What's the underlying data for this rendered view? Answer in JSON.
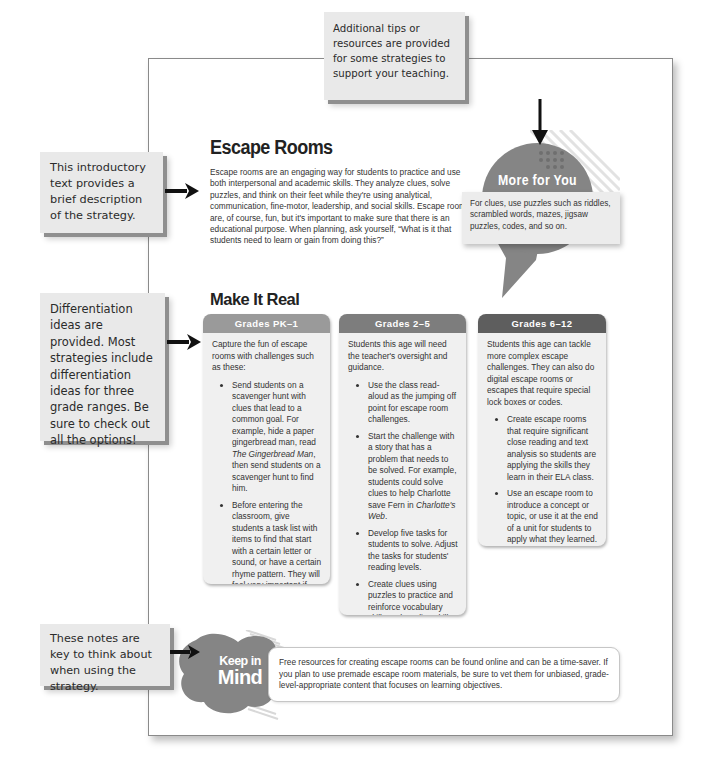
{
  "callouts": {
    "resources": "Additional tips or resources are provided for some strategies to support your teaching.",
    "intro": "This introductory text provides a brief description of the strategy.",
    "differentiation": "Differentiation ideas are provided. Most strategies include differentiation ideas for three grade ranges. Be sure to check out all the options!",
    "keep_in_mind": "These notes are key to think about when using the strategy."
  },
  "strategy": {
    "title": "Escape Rooms",
    "description": "Escape rooms are an engaging way for students to practice and use both interpersonal and academic skills. They analyze clues, solve puzzles, and think on their feet while they're using analytical, communication, fine-motor, leadership, and social skills. Escape rooms are, of course, fun, but it's important to make sure that there is an educational purpose. When planning, ask yourself, “What is it that students need to learn or gain from doing this?”"
  },
  "more_for_you": {
    "title": "More for You",
    "text": "For clues, use puzzles such as riddles, scrambled words, mazes, jigsaw puzzles, codes, and so on."
  },
  "make_it_real": {
    "title": "Make It Real",
    "cards": [
      {
        "header": "Grades PK–1",
        "header_color": "#9a9a9a",
        "intro": "Capture the fun of escape rooms with challenges such as these:",
        "bullets": [
          {
            "before": "Send students on a scavenger hunt with clues that lead to a common goal. For example, hide a paper gingerbread man, read ",
            "italic": "The Gingerbread Man",
            "after": ", then send students on a scavenger hunt to find him."
          },
          {
            "before": "Before entering the classroom, give students a task list with items to find that start with a certain letter or sound, or have a certain rhyme pattern. They will feel very important if you give them clipboards!",
            "italic": "",
            "after": ""
          }
        ]
      },
      {
        "header": "Grades 2–5",
        "header_color": "#7d7d7d",
        "intro": "Students this age will need the teacher's oversight and guidance.",
        "bullets": [
          {
            "before": "Use the class read-aloud as the jumping off point for escape room challenges.",
            "italic": "",
            "after": ""
          },
          {
            "before": "Start the challenge with a story that has a problem that needs to be solved. For example, students could solve clues to help Charlotte save Fern in ",
            "italic": "Charlotte's Web",
            "after": "."
          },
          {
            "before": "Develop five tasks for students to solve. Adjust the tasks for students' reading levels.",
            "italic": "",
            "after": ""
          },
          {
            "before": "Create clues using puzzles to practice and reinforce vocabulary skills and reading skills.",
            "italic": "",
            "after": ""
          }
        ]
      },
      {
        "header": "Grades 6–12",
        "header_color": "#5e5e5e",
        "intro": "Students this age can tackle more complex escape challenges. They can also do digital escape rooms or escapes that require special lock boxes or codes.",
        "bullets": [
          {
            "before": "Create escape rooms that require significant close reading and text analysis so students are applying the skills they learn in their ELA class.",
            "italic": "",
            "after": ""
          },
          {
            "before": "Use an escape room to introduce a concept or topic, or use it at the end of a unit for students to apply what they learned.",
            "italic": "",
            "after": ""
          }
        ]
      }
    ]
  },
  "keep_in_mind": {
    "title_line1": "Keep in",
    "title_line2": "Mind",
    "text": "Free resources for creating escape rooms can be found online and can be a time-saver. If you plan to use premade escape room materials, be sure to vet them for unbiased, grade-level-appropriate content that focuses on learning objectives."
  },
  "colors": {
    "callout_bg": "#e9e9e9",
    "callout_shadow": "#8f8f8f",
    "bubble": "#858585",
    "card_bg": "#f0f0f0"
  }
}
